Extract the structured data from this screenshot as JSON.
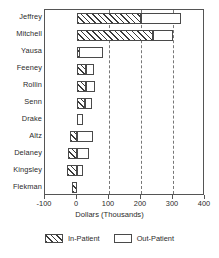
{
  "chart_data": {
    "type": "bar",
    "orientation": "horizontal",
    "stacked": true,
    "title": "",
    "xlabel": "Dollars (Thousands)",
    "ylabel": "",
    "xlim": [
      -100,
      400
    ],
    "xticks": [
      -100,
      0,
      100,
      200,
      300,
      400
    ],
    "xticklabels": [
      "-100",
      "0",
      "100",
      "200",
      "300",
      "400"
    ],
    "gridlines": [
      100,
      200,
      300
    ],
    "grid": "vertical-dashed",
    "legend_position": "bottom-center",
    "categories": [
      "Jeffrey",
      "Mitchell",
      "Yausa",
      "Feeney",
      "Rollin",
      "Senn",
      "Drake",
      "Altz",
      "Delaney",
      "Kingsley",
      "Flekman"
    ],
    "series": [
      {
        "name": "In-Patient",
        "style": "hatched",
        "values": [
          200,
          237,
          5,
          28,
          28,
          25,
          0,
          -22,
          -28,
          -30,
          -15
        ]
      },
      {
        "name": "Out-Patient",
        "style": "open",
        "values": [
          125,
          63,
          75,
          25,
          28,
          22,
          20,
          50,
          37,
          20,
          0
        ]
      }
    ]
  },
  "axis": {
    "x_title": "Dollars (Thousands)"
  },
  "legend": {
    "items": [
      {
        "label": "In-Patient",
        "swatch": "hatched-swatch"
      },
      {
        "label": "Out-Patient",
        "swatch": "open-swatch"
      }
    ]
  }
}
